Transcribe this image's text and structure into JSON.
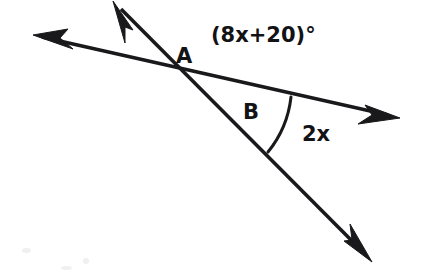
{
  "figure": {
    "kind": "angle-diagram",
    "background_color": "#ffffff",
    "ink_color": "#19191c",
    "width": 432,
    "height": 280
  },
  "labels": {
    "vertex_a": "A",
    "angle_expression": "(8x+20)°",
    "angle_b": "B",
    "angle_2x": "2x"
  },
  "geometry": {
    "intersection_point": {
      "x": 188,
      "y": 73
    },
    "lines": [
      {
        "name": "shallow-line",
        "from": {
          "x": 33,
          "y": 35
        },
        "to": {
          "x": 400,
          "y": 118
        },
        "arrow_start": true,
        "arrow_end": true
      },
      {
        "name": "steep-line",
        "from": {
          "x": 113,
          "y": 2
        },
        "to": {
          "x": 372,
          "y": 262
        },
        "arrow_start": true,
        "arrow_end": true
      }
    ],
    "arc": {
      "name": "angle-2x-arc",
      "center": {
        "x": 188,
        "y": 73
      },
      "radius": 106,
      "start_point": {
        "x": 291,
        "y": 97
      },
      "end_point": {
        "x": 268,
        "y": 152
      }
    }
  }
}
